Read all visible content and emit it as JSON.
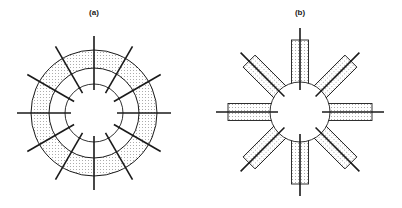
{
  "panels": [
    {
      "id": "a",
      "label": "(a)",
      "label_pos": [
        94,
        8
      ],
      "center": [
        94,
        113
      ],
      "rings": {
        "outer_radius": 63,
        "middle_radius": 45,
        "inner_radius": 29
      },
      "spokes": {
        "count": 12,
        "start_angle_deg": 90,
        "r_start": 23,
        "r_end": 77
      },
      "shaded_band": "between outer and middle rings"
    },
    {
      "id": "b",
      "label": "(b)",
      "label_pos": [
        300,
        8
      ],
      "center": [
        300,
        112
      ],
      "hub_radius": 30,
      "arms": {
        "count": 8,
        "start_angle_deg": 90,
        "rect_r_start": 28,
        "rect_r_end": 72,
        "rect_width": 17,
        "spoke_r_start": 22,
        "spoke_r_end": 84
      }
    }
  ],
  "colors": {
    "stroke": "#1a1a1a",
    "fill_dots": "#555555",
    "background": "#ffffff"
  }
}
